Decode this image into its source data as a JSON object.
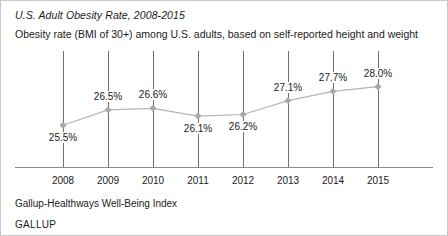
{
  "chart_data": {
    "type": "line",
    "title": "U.S. Adult Obesity Rate, 2008-2015",
    "subtitle": "Obesity rate (BMI of 30+) among U.S. adults, based on self-reported height and weight",
    "xlabel": "",
    "ylabel": "",
    "grid": "vertical-only",
    "legend": "none",
    "categories": [
      "2008",
      "2009",
      "2010",
      "2011",
      "2012",
      "2013",
      "2014",
      "2015"
    ],
    "values": [
      25.5,
      26.5,
      26.6,
      26.1,
      26.2,
      27.1,
      27.7,
      28.0
    ],
    "point_labels": [
      "25.5%",
      "26.5%",
      "26.6%",
      "26.1%",
      "26.2%",
      "27.1%",
      "27.7%",
      "28.0%"
    ],
    "label_positions": [
      "below",
      "above",
      "above",
      "below",
      "below",
      "above",
      "above",
      "above"
    ],
    "ylim": [
      25.0,
      28.5
    ],
    "series_color": "#b4b4b4",
    "marker_color": "#a8a8a8",
    "marker_shape": "diamond",
    "axis_color": "#8a8a8a",
    "gridline_color": "#6e6e6e"
  },
  "footer": {
    "source": "Gallup-Healthways Well-Being Index",
    "brand": "GALLUP"
  }
}
